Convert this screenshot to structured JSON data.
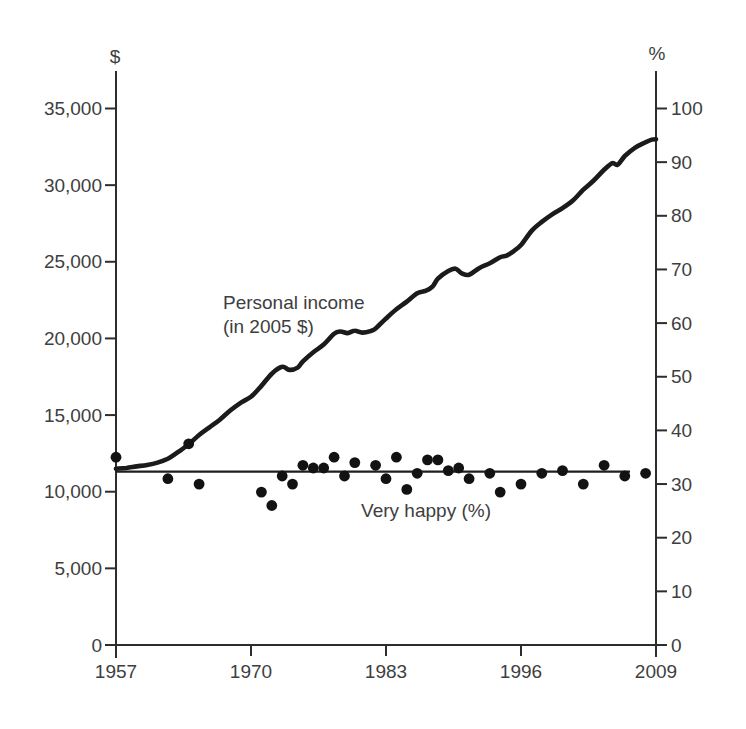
{
  "colors": {
    "background": "#ffffff",
    "axis": "#2d2d2d",
    "text": "#3e3e3e",
    "income_curve": "#1b1b1b",
    "trend_line": "#1f1f1f",
    "dots": "#121212"
  },
  "chart_data": {
    "type": "line",
    "title": "",
    "x_axis": {
      "range": [
        1957,
        2009
      ],
      "ticks": [
        {
          "v": 1957,
          "label": "1957"
        },
        {
          "v": 1970,
          "label": "1970"
        },
        {
          "v": 1983,
          "label": "1983"
        },
        {
          "v": 1996,
          "label": "1996"
        },
        {
          "v": 2009,
          "label": "2009"
        }
      ]
    },
    "left_axis": {
      "unit_label": "$",
      "range": [
        0,
        35000
      ],
      "ticks": [
        {
          "v": 0,
          "label": "0"
        },
        {
          "v": 5000,
          "label": "5,000"
        },
        {
          "v": 10000,
          "label": "10,000"
        },
        {
          "v": 15000,
          "label": "15,000"
        },
        {
          "v": 20000,
          "label": "20,000"
        },
        {
          "v": 25000,
          "label": "25,000"
        },
        {
          "v": 30000,
          "label": "30,000"
        },
        {
          "v": 35000,
          "label": "35,000"
        }
      ]
    },
    "right_axis": {
      "unit_label": "%",
      "range": [
        0,
        100
      ],
      "ticks": [
        {
          "v": 0,
          "label": "0"
        },
        {
          "v": 10,
          "label": "10"
        },
        {
          "v": 20,
          "label": "20"
        },
        {
          "v": 30,
          "label": "30"
        },
        {
          "v": 40,
          "label": "40"
        },
        {
          "v": 50,
          "label": "50"
        },
        {
          "v": 60,
          "label": "60"
        },
        {
          "v": 70,
          "label": "70"
        },
        {
          "v": 80,
          "label": "80"
        },
        {
          "v": 90,
          "label": "90"
        },
        {
          "v": 100,
          "label": "100"
        }
      ]
    },
    "series": [
      {
        "name": "Personal income (in 2005 $)",
        "type": "line",
        "axis": "left",
        "style": "thick-smooth",
        "points": [
          [
            1957,
            11500
          ],
          [
            1958,
            11550
          ],
          [
            1959,
            11650
          ],
          [
            1960,
            11750
          ],
          [
            1961,
            11900
          ],
          [
            1962,
            12150
          ],
          [
            1963,
            12600
          ],
          [
            1964,
            13100
          ],
          [
            1965,
            13700
          ],
          [
            1966,
            14200
          ],
          [
            1967,
            14700
          ],
          [
            1968,
            15300
          ],
          [
            1969,
            15800
          ],
          [
            1970,
            16200
          ],
          [
            1971,
            16900
          ],
          [
            1972,
            17700
          ],
          [
            1973,
            18150
          ],
          [
            1973.7,
            17950
          ],
          [
            1974.5,
            18100
          ],
          [
            1975,
            18500
          ],
          [
            1976,
            19100
          ],
          [
            1977,
            19600
          ],
          [
            1978,
            20300
          ],
          [
            1978.6,
            20450
          ],
          [
            1979.3,
            20350
          ],
          [
            1980,
            20500
          ],
          [
            1980.7,
            20380
          ],
          [
            1981.5,
            20480
          ],
          [
            1982,
            20650
          ],
          [
            1983,
            21300
          ],
          [
            1984,
            21900
          ],
          [
            1985,
            22400
          ],
          [
            1986,
            22950
          ],
          [
            1986.8,
            23100
          ],
          [
            1987.5,
            23400
          ],
          [
            1988,
            23900
          ],
          [
            1989,
            24400
          ],
          [
            1989.7,
            24550
          ],
          [
            1990.3,
            24250
          ],
          [
            1991,
            24150
          ],
          [
            1992,
            24600
          ],
          [
            1993,
            24900
          ],
          [
            1994,
            25300
          ],
          [
            1994.6,
            25400
          ],
          [
            1995.2,
            25650
          ],
          [
            1996,
            26100
          ],
          [
            1997,
            27000
          ],
          [
            1998,
            27600
          ],
          [
            1999,
            28100
          ],
          [
            2000,
            28500
          ],
          [
            2001,
            29000
          ],
          [
            2002,
            29700
          ],
          [
            2003,
            30300
          ],
          [
            2004,
            31000
          ],
          [
            2004.8,
            31430
          ],
          [
            2005.3,
            31330
          ],
          [
            2006,
            31900
          ],
          [
            2007,
            32450
          ],
          [
            2008,
            32800
          ],
          [
            2008.6,
            32970
          ],
          [
            2009,
            33000
          ]
        ]
      },
      {
        "name": "Very happy (%) trend",
        "type": "line",
        "axis": "right",
        "style": "thin-straight",
        "points": [
          [
            1957,
            32.3
          ],
          [
            2006.5,
            32.3
          ]
        ]
      },
      {
        "name": "Very happy (%)",
        "type": "scatter",
        "axis": "right",
        "points": [
          [
            1957,
            35
          ],
          [
            1962,
            31
          ],
          [
            1964,
            37.5
          ],
          [
            1965,
            30
          ],
          [
            1971,
            28.5
          ],
          [
            1972,
            26
          ],
          [
            1973,
            31.5
          ],
          [
            1974,
            30
          ],
          [
            1975,
            33.5
          ],
          [
            1976,
            33
          ],
          [
            1977,
            33
          ],
          [
            1978,
            35
          ],
          [
            1979,
            31.5
          ],
          [
            1980,
            34
          ],
          [
            1982,
            33.5
          ],
          [
            1983,
            31
          ],
          [
            1984,
            35
          ],
          [
            1985,
            29
          ],
          [
            1986,
            32
          ],
          [
            1987,
            34.5
          ],
          [
            1988,
            34.5
          ],
          [
            1989,
            32.5
          ],
          [
            1990,
            33
          ],
          [
            1991,
            31
          ],
          [
            1993,
            32
          ],
          [
            1994,
            28.5
          ],
          [
            1996,
            30
          ],
          [
            1998,
            32
          ],
          [
            2000,
            32.5
          ],
          [
            2002,
            30
          ],
          [
            2004,
            33.5
          ],
          [
            2006,
            31.5
          ],
          [
            2008,
            32
          ]
        ]
      }
    ],
    "annotations": [
      {
        "id": "income-label-line1",
        "text": "Personal income",
        "year": 1967.3,
        "pct": 63.9,
        "anchor": "start"
      },
      {
        "id": "income-label-line2",
        "text": "(in 2005 $)",
        "year": 1967.3,
        "pct": 59.4,
        "anchor": "start"
      },
      {
        "id": "happy-label",
        "text": "Very happy (%)",
        "year": 1980.6,
        "pct": 25.0,
        "anchor": "start"
      }
    ],
    "layout_hints": {
      "grid": false,
      "legend": "none",
      "left_axis_top_label_above_axis": true,
      "scatter_dot_radius_px": 5.4
    }
  }
}
